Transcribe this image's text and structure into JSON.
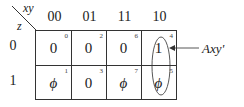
{
  "kmap": {
    "corner": {
      "col_var": "xy",
      "row_var": "z"
    },
    "col_headers": [
      "00",
      "01",
      "11",
      "10"
    ],
    "row_headers": [
      "0",
      "1"
    ],
    "cells": [
      [
        {
          "value": "0",
          "index": "0"
        },
        {
          "value": "0",
          "index": "2"
        },
        {
          "value": "0",
          "index": "6"
        },
        {
          "value": "1",
          "index": "4"
        }
      ],
      [
        {
          "value": "ϕ",
          "index": "1"
        },
        {
          "value": "0",
          "index": "3"
        },
        {
          "value": "ϕ",
          "index": "7"
        },
        {
          "value": "ϕ",
          "index": "5"
        }
      ]
    ],
    "grouping": {
      "label": "Axy'",
      "column": "10",
      "rows": [
        "0",
        "1"
      ]
    }
  },
  "colors": {
    "line": "#333333",
    "text": "#222222",
    "background": "#ffffff"
  }
}
